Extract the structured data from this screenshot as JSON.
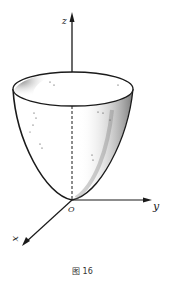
{
  "figure": {
    "caption": "图 16",
    "axes": {
      "x": "x",
      "y": "y",
      "z": "z",
      "origin": "O"
    },
    "surface": "paraboloid",
    "colors": {
      "ink": "#1a1a1a",
      "background": "#ffffff"
    }
  }
}
